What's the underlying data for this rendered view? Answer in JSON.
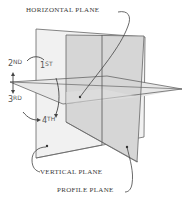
{
  "diagram": {
    "labels": {
      "horizontal_plane": "HORIZONTAL PLANE",
      "vertical_plane": "VERTICAL PLANE",
      "profile_plane": "PROFILE PLANE"
    },
    "quadrants": [
      {
        "num": "1",
        "suffix": "ST"
      },
      {
        "num": "2",
        "suffix": "ND"
      },
      {
        "num": "3",
        "suffix": "RD"
      },
      {
        "num": "4",
        "suffix": "TH"
      }
    ],
    "colors": {
      "line": "#555555",
      "vertical_plane_fill": "#f1f1f1",
      "profile_plane_fill": "#d9d9d9",
      "horizontal_plane_fill": "#e6e6e6"
    }
  }
}
